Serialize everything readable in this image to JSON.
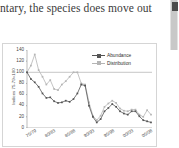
{
  "document": {
    "text_fragment": "ntary, the species does move out"
  },
  "scrollbar": {
    "name": "vertical-scrollbar"
  },
  "chart_data": {
    "type": "line",
    "title": "",
    "xlabel": "",
    "ylabel": "Indices 75-79=100",
    "ylim": [
      0,
      140
    ],
    "yticks": [
      140,
      120,
      100,
      80,
      60,
      40,
      20,
      0
    ],
    "grid": false,
    "legend_position": "top-right",
    "reference_line": 100,
    "categories": [
      "75/79",
      "76/80",
      "77/81",
      "78/82",
      "79/83",
      "80/83",
      "81/85",
      "82/86",
      "83/87",
      "84/88",
      "85/88",
      "86/90",
      "87/91",
      "88/92",
      "89/93",
      "90/93",
      "91/95",
      "92/96",
      "93/97",
      "94/98",
      "95/98",
      "96/00",
      "97/01",
      "98/02",
      "99/03",
      "00/03",
      "01/05",
      "02/06",
      "03/07",
      "04/08",
      "05/08",
      "06/10",
      "07/11"
    ],
    "xtick_labels": [
      "75/79",
      "80/83",
      "85/88",
      "90/93",
      "95/98",
      "00/03",
      "05/08"
    ],
    "series": [
      {
        "name": "Abundance",
        "color": "#555555",
        "marker": "square",
        "values": [
          100,
          88,
          82,
          74,
          62,
          54,
          55,
          48,
          45,
          46,
          49,
          47,
          52,
          62,
          78,
          76,
          40,
          20,
          10,
          16,
          30,
          36,
          43,
          38,
          30,
          26,
          24,
          30,
          30,
          21,
          14,
          12,
          10
        ]
      },
      {
        "name": "Distribution",
        "color": "#b5b5b5",
        "marker": "square",
        "values": [
          100,
          112,
          132,
          104,
          92,
          78,
          86,
          70,
          68,
          78,
          84,
          92,
          100,
          100,
          80,
          78,
          46,
          22,
          14,
          22,
          38,
          44,
          49,
          45,
          35,
          31,
          30,
          33,
          33,
          24,
          20,
          32,
          24
        ]
      }
    ]
  }
}
